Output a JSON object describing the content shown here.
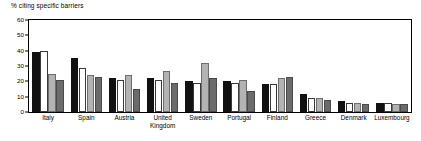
{
  "chart_data": {
    "type": "bar",
    "title": "% citing specific barriers",
    "xlabel": "",
    "ylabel": "",
    "ylim": [
      0,
      60
    ],
    "yticks": [
      0,
      10,
      20,
      30,
      40,
      50,
      60
    ],
    "grid": false,
    "legend": "none",
    "categories": [
      "Italy",
      "Spain",
      "Austria",
      "United\nKingdom",
      "Sweden",
      "Portugal",
      "Finland",
      "Greece",
      "Denmark",
      "Luxembourg"
    ],
    "series": [
      {
        "name": "series-1",
        "color": "#111111",
        "values": [
          39,
          35,
          22,
          22,
          20,
          20,
          18,
          12,
          7,
          6
        ]
      },
      {
        "name": "series-2",
        "color": "#ffffff",
        "values": [
          40,
          29,
          21,
          21,
          19,
          19,
          18,
          9,
          6,
          6
        ]
      },
      {
        "name": "series-3",
        "color": "#b3b3b3",
        "values": [
          25,
          24,
          24,
          27,
          32,
          21,
          22,
          9,
          6,
          5
        ]
      },
      {
        "name": "series-4",
        "color": "#6b6b6b",
        "values": [
          21,
          23,
          15,
          19,
          22,
          14,
          23,
          8,
          5,
          5
        ]
      }
    ]
  },
  "axis": {
    "y_tick_labels": [
      "60",
      "50",
      "40",
      "30",
      "20",
      "10",
      "0"
    ]
  }
}
